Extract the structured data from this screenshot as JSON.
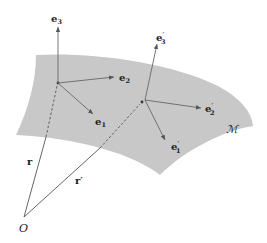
{
  "figure": {
    "manifold_label": "ℳ",
    "origin_label": "O",
    "position_vectors": [
      {
        "label": "r",
        "from": "O",
        "to": "P"
      },
      {
        "label": "r′",
        "from": "O",
        "to": "P′"
      }
    ],
    "frame_at_P": [
      {
        "base": "e",
        "sub": "1",
        "prime": ""
      },
      {
        "base": "e",
        "sub": "2",
        "prime": ""
      },
      {
        "base": "e",
        "sub": "3",
        "prime": ""
      }
    ],
    "frame_at_P_prime": [
      {
        "base": "e",
        "sub": "1",
        "prime": "′"
      },
      {
        "base": "e",
        "sub": "2",
        "prime": "′"
      },
      {
        "base": "e",
        "sub": "3",
        "prime": "′"
      }
    ],
    "colors": {
      "surface": "#c8c8c8",
      "lines": "#555555",
      "text": "#222222"
    }
  }
}
